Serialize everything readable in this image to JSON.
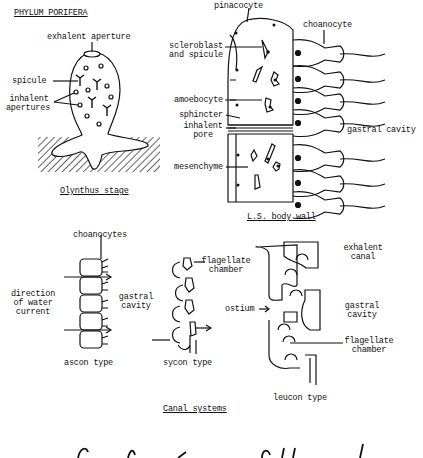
{
  "title": "PHYLUM PORIFERA",
  "olynthus": {
    "caption": "Olynthus stage",
    "labels": {
      "exhalent_aperture": "exhalent aperture",
      "spicule": "spicule",
      "inhalent_apertures_1": "inhalent",
      "inhalent_apertures_2": "apertures"
    }
  },
  "body_wall": {
    "caption": "L.S. body wall",
    "labels": {
      "pinacocyte": "pinacocyte",
      "choanocyte": "choanocyte",
      "scleroblast_1": "scleroblast",
      "scleroblast_2": "and spicule",
      "amoebocyte": "amoebocyte",
      "sphincter": "sphincter",
      "inhalent_pore_1": "inhalent",
      "inhalent_pore_2": "pore",
      "mesenchyme": "mesenchyme",
      "gastral_cavity": "gastral cavity"
    }
  },
  "canal_systems": {
    "caption": "Canal systems",
    "ascon": {
      "caption": "ascon type",
      "choanocytes": "choanocytes",
      "direction_1": "direction",
      "direction_2": "of water",
      "direction_3": "current",
      "gastral_1": "gastral",
      "gastral_2": "cavity"
    },
    "sycon": {
      "caption": "sycon type",
      "flagellate_1": "flagellate",
      "flagellate_2": "chamber"
    },
    "leucon": {
      "caption": "leucon type",
      "ostium": "ostium",
      "exhalent_1": "exhalent",
      "exhalent_2": "canal",
      "gastral_1": "gastral",
      "gastral_2": "cavity",
      "flagellate_1": "flagellate",
      "flagellate_2": "chamber"
    }
  }
}
